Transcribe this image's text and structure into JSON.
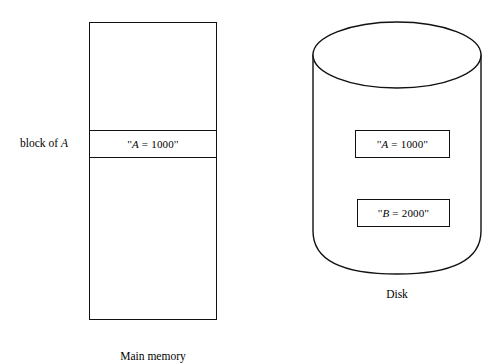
{
  "figure": {
    "type": "diagram",
    "background_color": "#ffffff",
    "stroke_color": "#111111"
  },
  "main_memory": {
    "caption": "Main memory",
    "block_label": "block of ",
    "block_label_var": "A",
    "block_cell": {
      "open_quote": "''",
      "var": "A",
      "operator": "=",
      "value": "1000",
      "close_quote": "''"
    }
  },
  "disk": {
    "caption": "Disk",
    "records": [
      {
        "open_quote": "''",
        "var": "A",
        "operator": "=",
        "value": "1000",
        "close_quote": "''"
      },
      {
        "open_quote": "''",
        "var": "B",
        "operator": "=",
        "value": "2000",
        "close_quote": "''"
      }
    ]
  }
}
